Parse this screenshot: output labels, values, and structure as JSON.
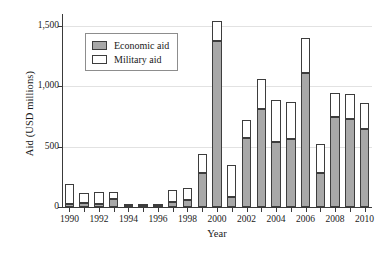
{
  "chart_data": {
    "type": "bar",
    "title": "",
    "subtitle": "",
    "xlabel": "Year",
    "ylabel": "Aid (USD millions)",
    "stacked": true,
    "grid": true,
    "legend_position": "upper-left-inside",
    "ylim": [
      0,
      1600
    ],
    "yticks": [
      0,
      500,
      1000,
      1500
    ],
    "ytick_labels": [
      "0",
      "500",
      "1,000",
      "1,500"
    ],
    "categories": [
      "1990",
      "1991",
      "1992",
      "1993",
      "1994",
      "1995",
      "1996",
      "1997",
      "1998",
      "1999",
      "2000",
      "2001",
      "2002",
      "2003",
      "2004",
      "2005",
      "2006",
      "2007",
      "2008",
      "2009",
      "2010"
    ],
    "xtick_labels": [
      "1990",
      "1992",
      "1994",
      "1996",
      "1998",
      "2000",
      "2002",
      "2004",
      "2006",
      "2008",
      "2010"
    ],
    "series": [
      {
        "name": "Economic aid",
        "color": "#a8a8a8",
        "values": [
          25,
          30,
          25,
          70,
          10,
          10,
          5,
          40,
          55,
          285,
          1375,
          80,
          570,
          810,
          540,
          560,
          1115,
          280,
          745,
          730,
          645
        ]
      },
      {
        "name": "Military aid",
        "color": "#ffffff",
        "values": [
          165,
          85,
          100,
          55,
          10,
          10,
          15,
          100,
          105,
          155,
          165,
          265,
          155,
          250,
          345,
          310,
          285,
          240,
          200,
          205,
          215
        ]
      }
    ],
    "totals": [
      190,
      115,
      125,
      125,
      20,
      20,
      20,
      140,
      160,
      440,
      1540,
      345,
      725,
      1060,
      885,
      870,
      1400,
      520,
      945,
      935,
      860
    ]
  },
  "legend": {
    "items": [
      {
        "label": "Economic aid",
        "swatch": "gray-filled-square"
      },
      {
        "label": "Military aid",
        "swatch": "white-filled-square"
      }
    ]
  }
}
